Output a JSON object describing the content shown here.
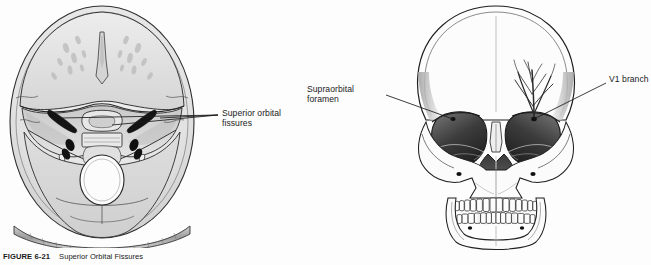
{
  "figure": {
    "caption_number": "FIGURE 6-21",
    "caption_text": "Superior Orbital Fissures",
    "background_color": "#fdfdfd",
    "ink_color": "#1b1b1b"
  },
  "panels": [
    {
      "id": "cranial-base-axial",
      "view": "Axial view of internal cranial base",
      "labels": [
        "Superior orbital fissures"
      ]
    },
    {
      "id": "skull-anterior",
      "view": "Anterior view of skull",
      "labels": [
        "Supraorbital foramen",
        "V1 branch"
      ]
    }
  ],
  "labels": {
    "superior_orbital_fissures": "Superior orbital\nfissures",
    "supraorbital_foramen": "Supraorbital\nforamen",
    "v1_branch": "V1 branch"
  },
  "colors": {
    "bone_light": "#ededed",
    "bone_mid": "#dcdcdc",
    "bone_shade": "#c6c6c6",
    "bone_dark": "#a9a9a9",
    "cavity_dark": "#5d5d5d",
    "foramen_black": "#151515",
    "outline": "#2a2a2a",
    "label_text": "#1b1b1b"
  }
}
